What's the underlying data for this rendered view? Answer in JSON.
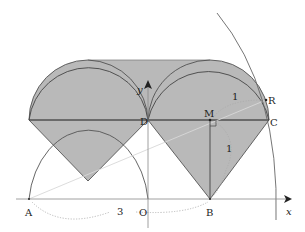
{
  "figure": {
    "colors": {
      "shade": "#b9b9b9",
      "stroke": "#555555",
      "axis": "#888888",
      "dotted": "#aaaaaa",
      "light_line": "#d0d0d0",
      "label": "#222222"
    }
  },
  "axes": {
    "x_label": "x",
    "y_label": "y"
  },
  "points": {
    "A": "A",
    "O": "O",
    "B": "B",
    "D": "D",
    "M": "M",
    "C": "C",
    "R": "R"
  },
  "measurements": {
    "MR": "1",
    "MB": "1",
    "AB": "3"
  }
}
